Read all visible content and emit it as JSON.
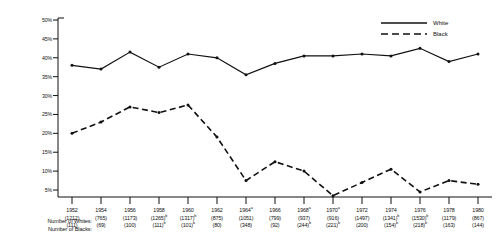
{
  "chart_data": {
    "type": "line",
    "title": "",
    "xlabel": "",
    "ylabel": "",
    "ylim": [
      0,
      50
    ],
    "yticks": [
      "5%",
      "10%",
      "15%",
      "20%",
      "25%",
      "30%",
      "35%",
      "40%",
      "45%",
      "50%"
    ],
    "ytick_values": [
      5,
      10,
      15,
      20,
      25,
      30,
      35,
      40,
      45,
      50
    ],
    "grid": false,
    "legend_position": "top-right",
    "categories": [
      "1952",
      "1954",
      "1956",
      "1958",
      "1960",
      "1962",
      "1964",
      "1966",
      "1968",
      "1970",
      "1972",
      "1974",
      "1976",
      "1978",
      "1980"
    ],
    "series": [
      {
        "name": "White",
        "style": "solid",
        "values": [
          38.0,
          37.0,
          41.5,
          37.5,
          41.0,
          40.0,
          35.5,
          38.5,
          40.5,
          40.5,
          41.0,
          40.5,
          42.5,
          39.0,
          41.0
        ]
      },
      {
        "name": "Black",
        "style": "dashed",
        "values": [
          20.0,
          23.0,
          27.0,
          25.5,
          27.5,
          19.0,
          7.5,
          12.5,
          10.0,
          3.5,
          7.0,
          10.5,
          4.5,
          7.5,
          6.5
        ]
      }
    ]
  },
  "legend": {
    "entries": [
      {
        "label": "White",
        "style": "solid"
      },
      {
        "label": "Black",
        "style": "dashed"
      }
    ]
  },
  "axis": {
    "y_labels": [
      "50%",
      "45%",
      "40%",
      "35%",
      "30%",
      "25%",
      "20%",
      "15%",
      "10%",
      "5%"
    ]
  },
  "footer": {
    "row_labels": [
      "Number of Whites:",
      "Number of Blacks:"
    ],
    "columns": [
      {
        "year": "1952",
        "year_sup": "",
        "whites": "(1212)",
        "whites_sup": "",
        "blacks": "(111)",
        "blacks_sup": ""
      },
      {
        "year": "1954",
        "year_sup": "",
        "whites": "(765)",
        "whites_sup": "",
        "blacks": "(69)",
        "blacks_sup": ""
      },
      {
        "year": "1956",
        "year_sup": "",
        "whites": "(1173)",
        "whites_sup": "",
        "blacks": "(100)",
        "blacks_sup": ""
      },
      {
        "year": "1958",
        "year_sup": "",
        "whites": "(1265)",
        "whites_sup": "b",
        "blacks": "(111)",
        "blacks_sup": "b"
      },
      {
        "year": "1960",
        "year_sup": "",
        "whites": "(1317)",
        "whites_sup": "b",
        "blacks": "(101)",
        "blacks_sup": "b"
      },
      {
        "year": "1962",
        "year_sup": "",
        "whites": "(875)",
        "whites_sup": "",
        "blacks": "(80)",
        "blacks_sup": ""
      },
      {
        "year": "1964",
        "year_sup": "a",
        "whites": "(1051)",
        "whites_sup": "",
        "blacks": "(348)",
        "blacks_sup": ""
      },
      {
        "year": "1966",
        "year_sup": "",
        "whites": "(799)",
        "whites_sup": "",
        "blacks": "(92)",
        "blacks_sup": ""
      },
      {
        "year": "1968",
        "year_sup": "a",
        "whites": "(937)",
        "whites_sup": "",
        "blacks": "(244)",
        "blacks_sup": "b"
      },
      {
        "year": "1970",
        "year_sup": "a",
        "whites": "(916)",
        "whites_sup": "",
        "blacks": "(221)",
        "blacks_sup": "b"
      },
      {
        "year": "1972",
        "year_sup": "",
        "whites": "(1497)",
        "whites_sup": "",
        "blacks": "(200)",
        "blacks_sup": ""
      },
      {
        "year": "1974",
        "year_sup": "",
        "whites": "(1341)",
        "whites_sup": "b",
        "blacks": "(154)",
        "blacks_sup": "b"
      },
      {
        "year": "1976",
        "year_sup": "",
        "whites": "(1530)",
        "whites_sup": "b",
        "blacks": "(218)",
        "blacks_sup": "b"
      },
      {
        "year": "1978",
        "year_sup": "",
        "whites": "(1179)",
        "whites_sup": "",
        "blacks": "(163)",
        "blacks_sup": ""
      },
      {
        "year": "1980",
        "year_sup": "",
        "whites": "(867)",
        "whites_sup": "",
        "blacks": "(144)",
        "blacks_sup": ""
      }
    ]
  },
  "colors": {
    "ink": "#111111",
    "background": "#ffffff"
  }
}
